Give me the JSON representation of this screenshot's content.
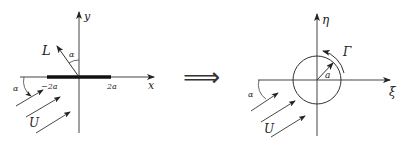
{
  "left": {
    "x_axis_label": "x",
    "y_axis_label": "y",
    "lift_label": "L",
    "angle_label_lift": "α",
    "angle_label_flow": "α",
    "plate_left_label": "−2a",
    "plate_right_label": "2a",
    "flow_label": "U"
  },
  "arrow_symbol": "⟹",
  "right": {
    "xi_axis_label": "ξ",
    "eta_axis_label": "η",
    "circulation_label": "Γ",
    "radius_label": "a",
    "angle_label_flow": "α",
    "flow_label": "U"
  },
  "colors": {
    "ink": "#222222",
    "background": "#ffffff"
  }
}
